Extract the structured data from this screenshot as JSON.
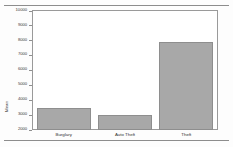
{
  "figure": {
    "frame_visible": true,
    "background": "#ffffff",
    "bar_color": "#a8a8a8",
    "bar_edge_color": "#8e8e8e",
    "axis_color": "#9a9a9a"
  },
  "document": {
    "rule_top": true,
    "rule_bottom": true
  },
  "chart_data": {
    "type": "bar",
    "title": "",
    "xlabel": "",
    "ylabel": "Mean",
    "categories": [
      "Burglary",
      "Auto Theft",
      "Theft"
    ],
    "values": [
      3500,
      3000,
      7900
    ],
    "ylim": [
      2000,
      10000
    ],
    "ytick_values": [
      2000,
      3000,
      4000,
      5000,
      6000,
      7000,
      8000,
      9000,
      10000
    ],
    "ytick_labels": [
      "2000",
      "3000",
      "4000",
      "5000",
      "6000",
      "7000",
      "8000",
      "9000",
      "10000"
    ],
    "grid": false,
    "legend": false,
    "orientation": "vertical"
  }
}
